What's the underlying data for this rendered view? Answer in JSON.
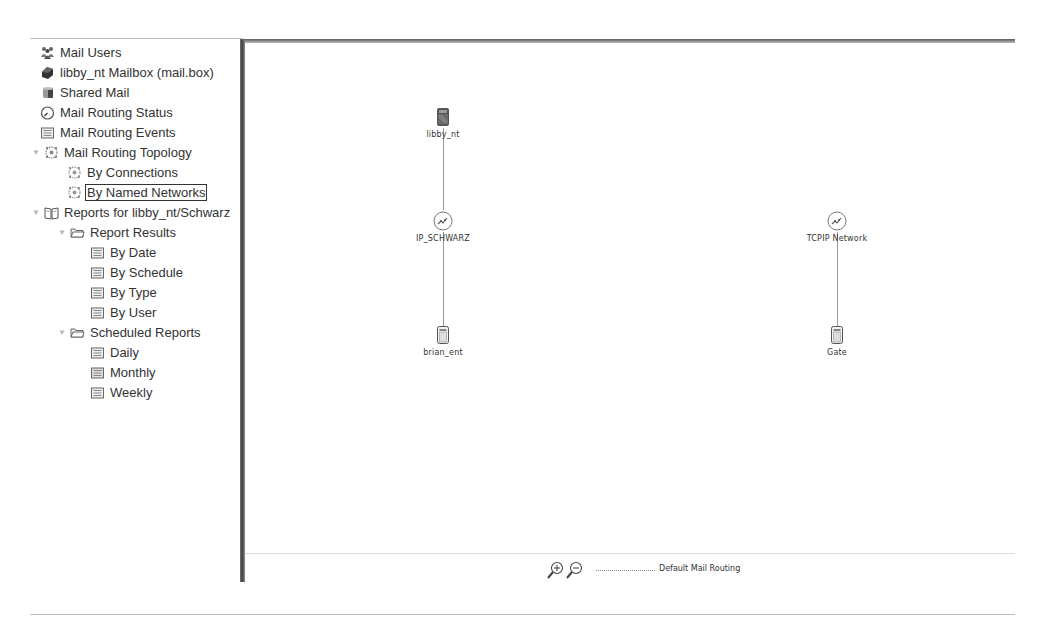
{
  "navigator": {
    "items": [
      {
        "label": "Mail Users",
        "icon": "mail-users-icon",
        "indent": 0,
        "twisty": null
      },
      {
        "label": "libby_nt Mailbox (mail.box)",
        "icon": "mailbox-icon",
        "indent": 0,
        "twisty": null
      },
      {
        "label": "Shared Mail",
        "icon": "shared-mail-icon",
        "indent": 0,
        "twisty": null
      },
      {
        "label": "Mail Routing Status",
        "icon": "gauge-icon",
        "indent": 0,
        "twisty": null
      },
      {
        "label": "Mail Routing Events",
        "icon": "events-list-icon",
        "indent": 0,
        "twisty": null
      },
      {
        "label": "Mail Routing Topology",
        "icon": "topology-icon",
        "indent": 0,
        "twisty": "expanded"
      },
      {
        "label": "By Connections",
        "icon": "topology-icon",
        "indent": 1,
        "twisty": null
      },
      {
        "label": "By Named Networks",
        "icon": "topology-icon",
        "indent": 1,
        "twisty": null,
        "selected": true
      },
      {
        "label": "Reports for libby_nt/Schwarz",
        "icon": "book-icon",
        "indent": 0,
        "twisty": "expanded"
      },
      {
        "label": "Report Results",
        "icon": "folder-icon",
        "indent": 1,
        "twisty": "expanded"
      },
      {
        "label": "By Date",
        "icon": "report-icon",
        "indent": 2,
        "twisty": null
      },
      {
        "label": "By Schedule",
        "icon": "report-icon",
        "indent": 2,
        "twisty": null
      },
      {
        "label": "By Type",
        "icon": "report-icon",
        "indent": 2,
        "twisty": null
      },
      {
        "label": "By User",
        "icon": "report-icon",
        "indent": 2,
        "twisty": null
      },
      {
        "label": "Scheduled Reports",
        "icon": "folder-icon",
        "indent": 1,
        "twisty": "expanded"
      },
      {
        "label": "Daily",
        "icon": "report-icon",
        "indent": 2,
        "twisty": null
      },
      {
        "label": "Monthly",
        "icon": "report-icon",
        "indent": 2,
        "twisty": null
      },
      {
        "label": "Weekly",
        "icon": "report-icon",
        "indent": 2,
        "twisty": null
      }
    ]
  },
  "topology": {
    "nodes": [
      {
        "id": "libby_nt",
        "label": "libby_nt",
        "type": "server"
      },
      {
        "id": "ip_schwarz",
        "label": "IP_SCHWARZ",
        "type": "network"
      },
      {
        "id": "brian_ent",
        "label": "brian_ent",
        "type": "server"
      },
      {
        "id": "tcpip_network",
        "label": "TCPIP Network",
        "type": "network"
      },
      {
        "id": "gate",
        "label": "Gate",
        "type": "server"
      }
    ]
  },
  "footer": {
    "zoom_in_icon": "zoom-in-icon",
    "zoom_out_icon": "zoom-out-icon",
    "legend_label": "Default Mail Routing"
  }
}
